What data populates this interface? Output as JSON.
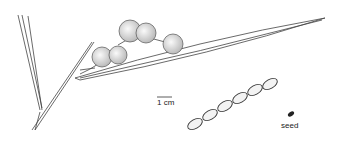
{
  "illustration": {
    "subject": "botanical drawing of wattle branch with flower heads, pod and seed",
    "labels": {
      "scale": "1 cm",
      "seed": "seed"
    },
    "colors": {
      "ink": "#333333",
      "background": "#ffffff"
    }
  }
}
